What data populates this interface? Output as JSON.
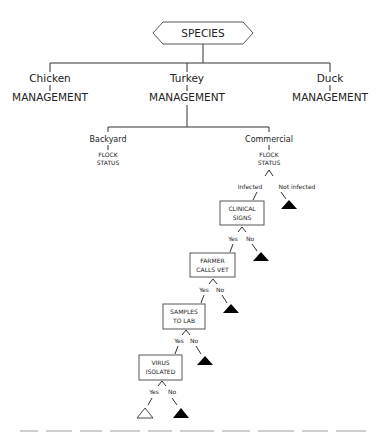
{
  "root": {
    "label": "SPECIES",
    "shape": "hexagon"
  },
  "species": [
    {
      "name": "Chicken",
      "sublabel": "MANAGEMENT"
    },
    {
      "name": "Turkey",
      "sublabel": "MANAGEMENT"
    },
    {
      "name": "Duck",
      "sublabel": "MANAGEMENT"
    }
  ],
  "management": [
    {
      "name": "Backyard",
      "status_line1": "FLOCK",
      "status_line2": "STATUS"
    },
    {
      "name": "Commercial",
      "status_line1": "FLOCK",
      "status_line2": "STATUS"
    }
  ],
  "flock_branches": {
    "left": "Infected",
    "right": "Not infected"
  },
  "steps": [
    {
      "line1": "CLINICAL",
      "line2": "SIGNS",
      "yes": "Yes",
      "no": "No"
    },
    {
      "line1": "FARMER",
      "line2": "CALLS VET",
      "yes": "Yes",
      "no": "No"
    },
    {
      "line1": "SAMPLES",
      "line2": "TO LAB",
      "yes": "Yes",
      "no": "No"
    },
    {
      "line1": "VIRUS",
      "line2": "ISOLATED",
      "yes": "Yes",
      "no": "No"
    }
  ],
  "legend": {
    "filled_triangle": "not detected (end node)",
    "open_triangle": "detected (end node)"
  }
}
